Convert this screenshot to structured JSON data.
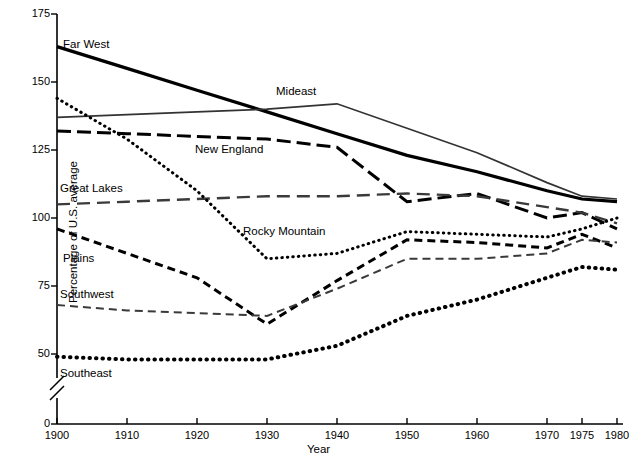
{
  "chart_data": {
    "type": "line",
    "title": "",
    "xlabel": "Year",
    "ylabel": "Percentage of U.S. average",
    "x": [
      1900,
      1910,
      1920,
      1930,
      1940,
      1950,
      1960,
      1970,
      1975,
      1980
    ],
    "xlim": [
      1900,
      1980
    ],
    "ylim": [
      0,
      175
    ],
    "y_axis_break": true,
    "y_break_between": [
      0,
      45
    ],
    "grid": false,
    "legend": "inline-labels",
    "xtick_labels": [
      "1900",
      "1910",
      "1920",
      "1930",
      "1940",
      "1950",
      "1960",
      "1970",
      "1975",
      "1980"
    ],
    "ytick_labels": [
      "0",
      "50",
      "75",
      "100",
      "125",
      "150",
      "175"
    ],
    "ytick_values": [
      0,
      50,
      75,
      100,
      125,
      150,
      175
    ],
    "series": [
      {
        "name": "Far West",
        "style": "solid-thick",
        "color": "#000000",
        "values": [
          163,
          155,
          147,
          139,
          131,
          123,
          117,
          110,
          107,
          106
        ]
      },
      {
        "name": "Mideast",
        "style": "solid-thin",
        "color": "#333333",
        "values": [
          137,
          138,
          139,
          140,
          142,
          133,
          124,
          113,
          108,
          107
        ]
      },
      {
        "name": "New England",
        "style": "dash-long",
        "color": "#000000",
        "values": [
          132,
          131,
          130,
          129,
          126,
          106,
          109,
          100,
          102,
          96
        ]
      },
      {
        "name": "Great Lakes",
        "style": "dash-medium-gray",
        "color": "#3a3a3a",
        "values": [
          105,
          106,
          107,
          108,
          108,
          109,
          108,
          104,
          102,
          98
        ]
      },
      {
        "name": "Rocky Mountain",
        "style": "dotted-fine",
        "color": "#000000",
        "values": [
          144,
          129,
          110,
          85,
          87,
          95,
          94,
          93,
          96,
          100
        ]
      },
      {
        "name": "Plains",
        "style": "dash-short",
        "color": "#000000",
        "values": [
          96,
          87,
          78,
          61,
          77,
          92,
          91,
          89,
          94,
          89
        ]
      },
      {
        "name": "Southwest",
        "style": "dash-fine-gray",
        "color": "#3a3a3a",
        "values": [
          68,
          66,
          65,
          64,
          74,
          85,
          85,
          87,
          92,
          91
        ]
      },
      {
        "name": "Southeast",
        "style": "dotted-bold",
        "color": "#000000",
        "values": [
          49,
          48,
          48,
          48,
          53,
          64,
          70,
          78,
          82,
          81
        ]
      }
    ],
    "series_label_positions": [
      {
        "name": "Far West",
        "x": 63,
        "y": 38
      },
      {
        "name": "Mideast",
        "x": 276,
        "y": 85
      },
      {
        "name": "New England",
        "x": 195,
        "y": 143
      },
      {
        "name": "Great Lakes",
        "x": 60,
        "y": 182
      },
      {
        "name": "Rocky Mountain",
        "x": 243,
        "y": 225
      },
      {
        "name": "Plains",
        "x": 63,
        "y": 252
      },
      {
        "name": "Southwest",
        "x": 60,
        "y": 288
      },
      {
        "name": "Southeast",
        "x": 60,
        "y": 367
      }
    ]
  }
}
